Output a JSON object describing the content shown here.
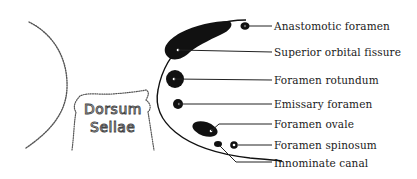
{
  "diagram": {
    "left_structure_label": {
      "line1": "Dorsum",
      "line2": "Sellae"
    },
    "labels": [
      {
        "id": "anastomotic-foramen",
        "text": "Anastomotic foramen"
      },
      {
        "id": "superior-orbital-fissure",
        "text": "Superior orbital fissure"
      },
      {
        "id": "foramen-rotundum",
        "text": "Foramen rotundum"
      },
      {
        "id": "emissary-foramen",
        "text": "Emissary foramen"
      },
      {
        "id": "foramen-ovale",
        "text": "Foramen ovale"
      },
      {
        "id": "foramen-spinosum",
        "text": "Foramen spinosum"
      },
      {
        "id": "innominate-canal",
        "text": "Innominate canal"
      }
    ],
    "colors": {
      "ink": "#111111",
      "dotted_outline": "#555555",
      "background": "#ffffff"
    }
  }
}
